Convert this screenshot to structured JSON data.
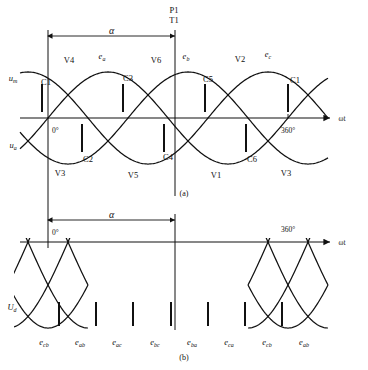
{
  "figure": {
    "caption_a": "(a)",
    "caption_b": "(b)",
    "alpha_symbol": "α",
    "axis_label": "ωt",
    "zero_label": "0°",
    "full_label": "360°"
  },
  "chart_data": {
    "type": "line",
    "xlabel": "ωt",
    "ylabel": "",
    "xlim": [
      -30,
      420
    ],
    "panels": [
      {
        "id": "a",
        "caption": "(a)",
        "description": "Three-phase source voltages with thyristor firing instants",
        "ylim": [
          -1.15,
          1.15
        ],
        "series": [
          {
            "name": "e_a",
            "phase_deg": 0,
            "amplitude": 1.0
          },
          {
            "name": "e_b",
            "phase_deg": -120,
            "amplitude": 1.0
          },
          {
            "name": "e_c",
            "phase_deg": -240,
            "amplitude": 1.0
          }
        ],
        "wave_labels": [
          {
            "text": "e",
            "sub": "a",
            "x": 102,
            "y": 59
          },
          {
            "text": "e",
            "sub": "b",
            "x": 186,
            "y": 59
          },
          {
            "text": "e",
            "sub": "c",
            "x": 268,
            "y": 57
          }
        ],
        "axis_labels": [
          {
            "text": "u",
            "sub": "m",
            "x": 13,
            "y": 81
          },
          {
            "text": "u",
            "sub": "a",
            "x": 13,
            "y": 148
          }
        ],
        "device_labels": [
          {
            "text": "V4",
            "x": 69,
            "y": 63
          },
          {
            "text": "V6",
            "x": 156,
            "y": 63
          },
          {
            "text": "V2",
            "x": 240,
            "y": 62
          },
          {
            "text": "V3",
            "x": 60,
            "y": 176
          },
          {
            "text": "V5",
            "x": 133,
            "y": 178
          },
          {
            "text": "V1",
            "x": 216,
            "y": 178
          },
          {
            "text": "V3",
            "x": 286,
            "y": 176
          }
        ],
        "commutation_labels": [
          {
            "text": "C1",
            "x": 46,
            "y": 85
          },
          {
            "text": "C3",
            "x": 128,
            "y": 81
          },
          {
            "text": "C5",
            "x": 208,
            "y": 82
          },
          {
            "text": "C1",
            "x": 295,
            "y": 83
          },
          {
            "text": "C2",
            "x": 88,
            "y": 162
          },
          {
            "text": "C4",
            "x": 168,
            "y": 160
          },
          {
            "text": "C6",
            "x": 252,
            "y": 162
          }
        ],
        "firing_pulses_upper": [
          {
            "x": 42,
            "y_top": 84,
            "y_bottom": 112
          },
          {
            "x": 123,
            "y_top": 84,
            "y_bottom": 112
          },
          {
            "x": 205,
            "y_top": 84,
            "y_bottom": 112
          },
          {
            "x": 288,
            "y_top": 84,
            "y_bottom": 112
          }
        ],
        "firing_pulses_lower": [
          {
            "x": 82,
            "y_top": 124,
            "y_bottom": 152
          },
          {
            "x": 164,
            "y_top": 124,
            "y_bottom": 152
          },
          {
            "x": 246,
            "y_top": 124,
            "y_bottom": 152
          }
        ],
        "trigger_marker": {
          "label_p": "P1",
          "label_t": "T1",
          "x": 175
        },
        "alpha_dim": {
          "x_start": 48,
          "x_end": 175,
          "y": 36
        }
      },
      {
        "id": "b",
        "caption": "(b)",
        "description": "Rectified output voltage Ud composed of line-to-line voltage segments",
        "ylim": [
          -1.15,
          0.2
        ],
        "output_label": {
          "text": "U",
          "sub": "d",
          "x": 12,
          "y": 310
        },
        "segment_labels": [
          {
            "text": "e",
            "sub": "cb",
            "x": 44,
            "y": 345
          },
          {
            "text": "e",
            "sub": "ab",
            "x": 80,
            "y": 345
          },
          {
            "text": "e",
            "sub": "ac",
            "x": 117,
            "y": 345
          },
          {
            "text": "e",
            "sub": "bc",
            "x": 155,
            "y": 345
          },
          {
            "text": "e",
            "sub": "ba",
            "x": 192,
            "y": 345
          },
          {
            "text": "e",
            "sub": "ca",
            "x": 229,
            "y": 345
          },
          {
            "text": "e",
            "sub": "cb",
            "x": 267,
            "y": 345
          },
          {
            "text": "e",
            "sub": "ab",
            "x": 304,
            "y": 345
          }
        ],
        "firing_pulses": [
          {
            "x": 59,
            "y_top": 302,
            "y_bottom": 326
          },
          {
            "x": 96,
            "y_top": 302,
            "y_bottom": 326
          },
          {
            "x": 133,
            "y_top": 302,
            "y_bottom": 326
          },
          {
            "x": 171,
            "y_top": 302,
            "y_bottom": 326
          },
          {
            "x": 208,
            "y_top": 302,
            "y_bottom": 326
          },
          {
            "x": 245,
            "y_top": 302,
            "y_bottom": 326
          },
          {
            "x": 282,
            "y_top": 302,
            "y_bottom": 326
          }
        ],
        "alpha_dim": {
          "x_start": 48,
          "x_end": 175,
          "y": 220
        }
      }
    ],
    "legend": {
      "position": "none"
    },
    "grid": false
  }
}
